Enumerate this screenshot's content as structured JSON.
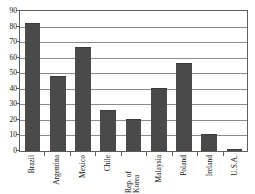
{
  "chart_data": {
    "type": "bar",
    "title": "",
    "xlabel": "",
    "ylabel": "",
    "ylim": [
      0,
      90
    ],
    "yticks": [
      0,
      10,
      20,
      30,
      40,
      50,
      60,
      70,
      80,
      90
    ],
    "grid": true,
    "legend": null,
    "categories": [
      "Brazil",
      "Argentina",
      "Mexico",
      "Chile",
      "Rep. of Korea",
      "Malaysia",
      "Poland",
      "Ireland",
      "U.S.A."
    ],
    "values": [
      82,
      48,
      67,
      26.5,
      20.5,
      40.5,
      56.5,
      11,
      1.3
    ],
    "bar_color": "#4a4a4a",
    "axis_color": "#5d5d5d",
    "gridline_color": "#8b8b8b"
  }
}
